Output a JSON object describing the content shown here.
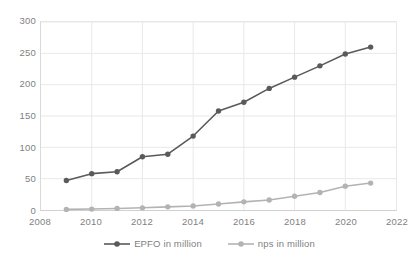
{
  "chart_data": {
    "type": "line",
    "title": "",
    "subtitle": "",
    "xlabel": "",
    "ylabel": "",
    "x": [
      2009,
      2010,
      2011,
      2012,
      2013,
      2014,
      2015,
      2016,
      2017,
      2018,
      2019,
      2020,
      2021
    ],
    "xlim": [
      2008,
      2022
    ],
    "ylim": [
      0,
      300
    ],
    "xticks": [
      "2008",
      "2010",
      "2012",
      "2014",
      "2016",
      "2018",
      "2020",
      "2022"
    ],
    "xtick_values": [
      2008,
      2010,
      2012,
      2014,
      2016,
      2018,
      2020,
      2022
    ],
    "yticks": [
      "0",
      "50",
      "100",
      "150",
      "200",
      "250",
      "300"
    ],
    "ytick_values": [
      0,
      50,
      100,
      150,
      200,
      250,
      300
    ],
    "grid": "horizontal-and-vertical",
    "legend_position": "bottom-center",
    "series": [
      {
        "name": "EPFO in million",
        "color": "#5a5a5a",
        "marker": "circle",
        "values": [
          47,
          58,
          61,
          85,
          89,
          118,
          158,
          172,
          194,
          212,
          230,
          249,
          260
        ]
      },
      {
        "name": "nps in million",
        "color": "#b3b3b3",
        "marker": "circle",
        "values": [
          1,
          1.5,
          2.5,
          3.5,
          5,
          6.5,
          9.5,
          13,
          16,
          22,
          28,
          38,
          43
        ]
      }
    ]
  },
  "legend": {
    "items": [
      {
        "label": "EPFO in million",
        "color": "#5a5a5a"
      },
      {
        "label": "nps in million",
        "color": "#b3b3b3"
      }
    ]
  },
  "colors": {
    "epfo": "#5a5a5a",
    "nps": "#b3b3b3",
    "gridline": "#e8e8e8",
    "axis": "#d0d0d0",
    "tick_text": "#7f7f7f",
    "background": "#ffffff"
  }
}
